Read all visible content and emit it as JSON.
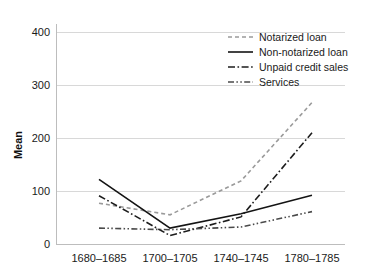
{
  "chart_data": {
    "type": "line",
    "title": "",
    "xlabel": "",
    "ylabel": "Mean",
    "categories": [
      "1680–1685",
      "1700–1705",
      "1740–1745",
      "1780–1785"
    ],
    "ylim": [
      0,
      420
    ],
    "yticks": [
      0,
      100,
      200,
      300,
      400
    ],
    "ytick_labels": [
      "0",
      "100",
      "200",
      "300",
      "400"
    ],
    "grid": "horizontal",
    "legend_position": "top-right",
    "series": [
      {
        "name": "Notarized loan",
        "style": "dashed",
        "color": "#9a9a9a",
        "values": [
          78,
          56,
          120,
          268
        ]
      },
      {
        "name": "Non-notarized loan",
        "style": "solid",
        "color": "#141414",
        "values": [
          123,
          31,
          58,
          93
        ]
      },
      {
        "name": "Unpaid credit sales",
        "style": "dashdot",
        "color": "#1d1d1d",
        "values": [
          92,
          17,
          52,
          211
        ]
      },
      {
        "name": "Services",
        "style": "dashdotdot",
        "color": "#4a4a4a",
        "values": [
          31,
          28,
          33,
          62
        ]
      }
    ]
  },
  "axes": {
    "y_label": "Mean",
    "y_ticks": [
      "0",
      "100",
      "200",
      "300",
      "400"
    ],
    "x_ticks": [
      "1680–1685",
      "1700–1705",
      "1740–1745",
      "1780–1785"
    ]
  },
  "legend": {
    "entries": [
      {
        "label": "Notarized loan"
      },
      {
        "label": "Non-notarized loan"
      },
      {
        "label": "Unpaid credit sales"
      },
      {
        "label": "Services"
      }
    ]
  }
}
